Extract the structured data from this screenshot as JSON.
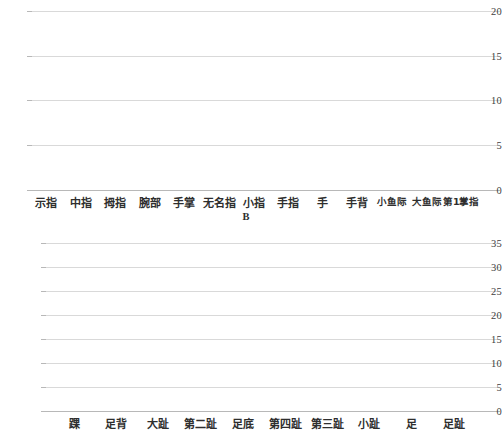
{
  "chart_data": [
    {
      "id": "chart-b",
      "type": "bar",
      "title": "",
      "xlabel": "B",
      "ylabel": "",
      "ylim": [
        0,
        21.2
      ],
      "yticks": [
        0,
        5,
        10,
        15,
        20
      ],
      "grid": true,
      "bar_color": "#a5a5a5",
      "clipped_top": true,
      "categories": [
        "示指",
        "中指",
        "拇指",
        "腕部",
        "手掌",
        "无名指",
        "小指",
        "手指",
        "手",
        "手背",
        "小鱼际",
        "大鱼际",
        "第1掌指"
      ],
      "values": [
        21,
        16,
        15,
        15,
        10,
        8,
        5,
        5,
        3,
        2,
        1,
        1,
        1
      ]
    },
    {
      "id": "chart-c",
      "type": "bar",
      "title": "",
      "xlabel": "",
      "ylabel": "",
      "ylim": [
        0,
        36
      ],
      "yticks": [
        0,
        5,
        10,
        15,
        20,
        25,
        30,
        35
      ],
      "grid": true,
      "bar_color": "#a5a5a5",
      "clipped_top": false,
      "categories": [
        "踝",
        "足背",
        "大趾",
        "第二趾",
        "足底",
        "第四趾",
        "第三趾",
        "小趾",
        "足",
        "足趾"
      ],
      "values": [
        33,
        18,
        7,
        5,
        4,
        2,
        1,
        1,
        8,
        2
      ]
    }
  ]
}
